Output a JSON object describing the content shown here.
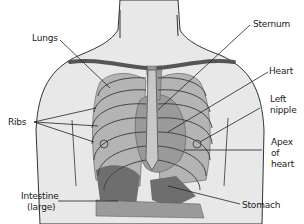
{
  "diagram": {
    "labels": {
      "lungs": "Lungs",
      "sternum": "Sternum",
      "heart": "Heart",
      "left_nipple_1": "Left",
      "left_nipple_2": "nipple",
      "ribs": "Ribs",
      "apex_1": "Apex",
      "apex_2": "of",
      "apex_3": "heart",
      "intestine_1": "Intestine",
      "intestine_2": "(large)",
      "stomach": "Stomach"
    },
    "colors": {
      "skin": "#e8e8e8",
      "lung": "#b4b4b4",
      "heart": "#9a9a9a",
      "organ_dark": "#6e6e6e",
      "outline": "#333333"
    }
  }
}
